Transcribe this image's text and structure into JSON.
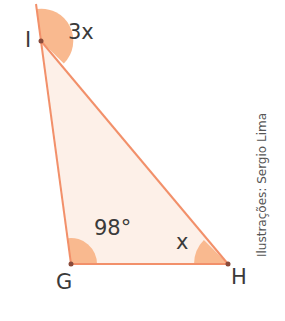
{
  "figure": {
    "vertices": [
      {
        "name": "I",
        "x": 41,
        "y": 41
      },
      {
        "name": "G",
        "x": 71,
        "y": 264
      },
      {
        "name": "H",
        "x": 228,
        "y": 264
      }
    ],
    "angles": {
      "exterior_I": "3x",
      "G": "98°",
      "H": "x"
    },
    "labels": {
      "I": "I",
      "G": "G",
      "H": "H"
    },
    "credit": "Ilustrações: Sergio Lima",
    "colors": {
      "fill": "#fdf0e8",
      "edge": "#f2906a",
      "arc": "#f9b98f",
      "vertex": "#8a4a3a",
      "text": "#3a3a3a"
    }
  }
}
